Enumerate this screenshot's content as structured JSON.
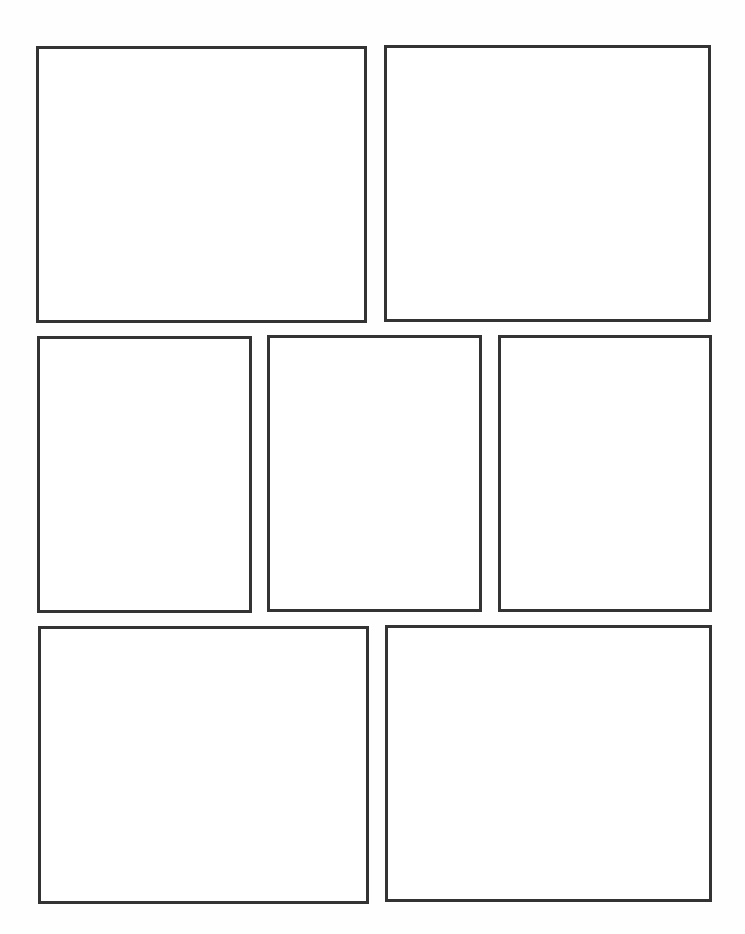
{
  "page": {
    "type": "comic-panel-template",
    "background_color": "#ffffff",
    "border_color": "#333333",
    "border_width": 3
  },
  "panels": [
    {
      "id": 1,
      "row": 1,
      "x": 36,
      "y": 46,
      "w": 331,
      "h": 277
    },
    {
      "id": 2,
      "row": 1,
      "x": 384,
      "y": 45,
      "w": 327,
      "h": 277
    },
    {
      "id": 3,
      "row": 2,
      "x": 37,
      "y": 336,
      "w": 215,
      "h": 277
    },
    {
      "id": 4,
      "row": 2,
      "x": 267,
      "y": 335,
      "w": 215,
      "h": 277
    },
    {
      "id": 5,
      "row": 2,
      "x": 498,
      "y": 335,
      "w": 214,
      "h": 277
    },
    {
      "id": 6,
      "row": 3,
      "x": 38,
      "y": 626,
      "w": 331,
      "h": 278
    },
    {
      "id": 7,
      "row": 3,
      "x": 385,
      "y": 625,
      "w": 327,
      "h": 277
    }
  ]
}
